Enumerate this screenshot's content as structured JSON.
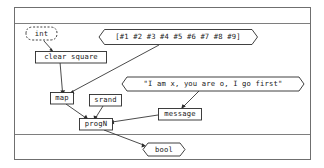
{
  "figure": {
    "background_color": "#ffffff",
    "line_color": "#2b2b2b",
    "frame_color": "#6f6f6f"
  },
  "bands": {
    "top_band": "",
    "bottom_band": ""
  },
  "nodes": {
    "int": {
      "label": "int",
      "shape": "lozenge-dashed"
    },
    "array": {
      "label": "[#1 #2 #3 #4 #5 #6 #7 #8 #9]",
      "shape": "lozenge"
    },
    "clear_square": {
      "label": "clear square",
      "shape": "box"
    },
    "message_string": {
      "label": "\"I am x, you are o, I go first\"",
      "shape": "lozenge"
    },
    "map": {
      "label": "map",
      "shape": "box"
    },
    "srand": {
      "label": "srand",
      "shape": "box"
    },
    "message": {
      "label": "message",
      "shape": "box"
    },
    "progn": {
      "label": "progN",
      "shape": "box"
    },
    "bool": {
      "label": "bool",
      "shape": "lozenge"
    }
  },
  "edges": [
    {
      "from": "int",
      "to": "clear_square"
    },
    {
      "from": "clear_square",
      "to": "map"
    },
    {
      "from": "array",
      "to": "map"
    },
    {
      "from": "message_string",
      "to": "message"
    },
    {
      "from": "map",
      "to": "progn"
    },
    {
      "from": "srand",
      "to": "progn"
    },
    {
      "from": "message",
      "to": "progn"
    },
    {
      "from": "progn",
      "to": "bool"
    }
  ]
}
